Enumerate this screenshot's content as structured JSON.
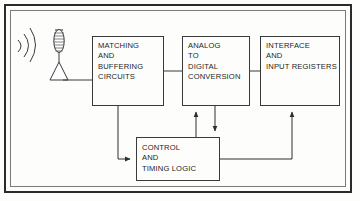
{
  "figure": {
    "background_color": "#fdfdfb",
    "line_color": "#3a3a3a",
    "border_color": "#2b2b2b"
  },
  "antenna": {
    "label": "antenna-symbol",
    "wave_count": 3,
    "description": "radio waves radiating toward antenna element"
  },
  "blocks": [
    {
      "id": "matching",
      "lines": [
        "MATCHING",
        "AND",
        "BUFFERING",
        "CIRCUITS"
      ]
    },
    {
      "id": "adc",
      "lines": [
        "ANALOG",
        "TO",
        "DIGITAL",
        "CONVERSION"
      ]
    },
    {
      "id": "interface",
      "lines": [
        "INTERFACE",
        "AND",
        "INPUT REGISTERS"
      ]
    },
    {
      "id": "control",
      "lines": [
        "CONTROL",
        "AND",
        "TIMING LOGIC"
      ]
    }
  ],
  "connections": [
    {
      "id": "antenna-to-matching",
      "from": "antenna",
      "to": "matching",
      "arrow": false
    },
    {
      "id": "matching-to-adc",
      "from": "matching",
      "to": "adc",
      "arrow": false
    },
    {
      "id": "adc-to-interface",
      "from": "adc",
      "to": "interface",
      "arrow": false
    },
    {
      "id": "matching-to-control",
      "from": "matching",
      "to": "control",
      "arrow": true
    },
    {
      "id": "control-to-adc",
      "from": "control",
      "to": "adc",
      "arrow": true
    },
    {
      "id": "adc-to-control",
      "from": "adc",
      "to": "control",
      "arrow": true
    },
    {
      "id": "control-to-interface",
      "from": "control",
      "to": "interface",
      "arrow": true
    }
  ]
}
